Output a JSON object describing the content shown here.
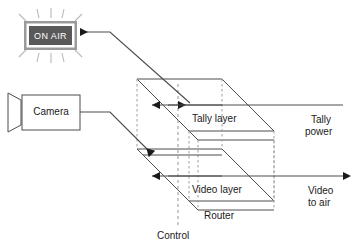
{
  "diagram": {
    "title_elements": {
      "on_air_sign": "ON AIR",
      "camera_box": "Camera"
    },
    "router": {
      "name": "Router",
      "layers": [
        {
          "id": "tally",
          "label": "Tally layer"
        },
        {
          "id": "video",
          "label": "Video layer"
        }
      ],
      "control_label": "Control"
    },
    "io_labels": {
      "tally_power_line1": "Tally",
      "tally_power_line2": "power",
      "video_out_line1": "Video",
      "video_out_line2": "to air"
    },
    "colors": {
      "stroke": "#4d4d4d",
      "dark_stroke": "#1a1a1a",
      "sign_fill": "#595959",
      "sign_border": "#ffffff",
      "sign_outer": "#8c8c8c",
      "sign_text": "#ffffff",
      "dashed": "#999999",
      "ray": "#b3b3b3",
      "background": "#ffffff"
    },
    "icons": {
      "on_air_arrow": "arrow-left-icon",
      "tally_power_arrow": "arrow-left-icon",
      "video_out_arrow": "arrow-right-icon",
      "tally_internal_arrow": "arrow-left-icon",
      "video_internal_arrow": "arrow-down-left-icon",
      "camera_lens": "camera-lens-icon",
      "sign_rays": "light-rays-icon"
    }
  }
}
